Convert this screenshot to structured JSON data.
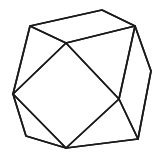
{
  "figure": {
    "background_color": "#ffffff",
    "stroke_color": "#1a1a1a",
    "stroke_width": 1.7,
    "canvas": {
      "width": 161,
      "height": 163
    }
  },
  "chart_data": {
    "type": "diagram",
    "vertices": [
      {
        "id": "v0",
        "name": "top-left",
        "x": 30,
        "y": 26
      },
      {
        "id": "v1",
        "name": "top-peak",
        "x": 102,
        "y": 10
      },
      {
        "id": "v2",
        "name": "top-right",
        "x": 135,
        "y": 26
      },
      {
        "id": "v3",
        "name": "right",
        "x": 151,
        "y": 71
      },
      {
        "id": "v4",
        "name": "bottom-right",
        "x": 138,
        "y": 139
      },
      {
        "id": "v5",
        "name": "bottom",
        "x": 66,
        "y": 148
      },
      {
        "id": "v6",
        "name": "bottom-left",
        "x": 26,
        "y": 136
      },
      {
        "id": "v7",
        "name": "left",
        "x": 13,
        "y": 94
      },
      {
        "id": "v8",
        "name": "inner-upper",
        "x": 66,
        "y": 43
      },
      {
        "id": "v9",
        "name": "inner-lower-right",
        "x": 119,
        "y": 99
      }
    ],
    "edges": [
      {
        "from": "v0",
        "to": "v1",
        "name": "outline-top-left-to-peak"
      },
      {
        "from": "v1",
        "to": "v2",
        "name": "outline-peak-to-top-right"
      },
      {
        "from": "v2",
        "to": "v3",
        "name": "outline-top-right-to-right"
      },
      {
        "from": "v3",
        "to": "v4",
        "name": "outline-right-to-bottom-right"
      },
      {
        "from": "v4",
        "to": "v5",
        "name": "outline-bottom-right-to-bottom"
      },
      {
        "from": "v5",
        "to": "v6",
        "name": "outline-bottom-to-bottom-left"
      },
      {
        "from": "v6",
        "to": "v7",
        "name": "outline-bottom-left-to-left"
      },
      {
        "from": "v7",
        "to": "v0",
        "name": "outline-left-to-top-left"
      },
      {
        "from": "v0",
        "to": "v8",
        "name": "inner-top-left-to-inner-upper"
      },
      {
        "from": "v2",
        "to": "v8",
        "name": "inner-top-right-to-inner-upper"
      },
      {
        "from": "v8",
        "to": "v7",
        "name": "inner-square-upper-left"
      },
      {
        "from": "v8",
        "to": "v9",
        "name": "inner-square-upper-right"
      },
      {
        "from": "v9",
        "to": "v5",
        "name": "inner-square-lower-right"
      },
      {
        "from": "v5",
        "to": "v7",
        "name": "inner-square-lower-left"
      },
      {
        "from": "v2",
        "to": "v9",
        "name": "inner-top-right-to-inner-lower"
      },
      {
        "from": "v4",
        "to": "v9",
        "name": "inner-bottom-right-to-inner-lower"
      }
    ],
    "paths": {
      "outline": "M30,26 L102,10 L135,26 L151,71 L138,139 L66,148 L26,136 L13,94 Z",
      "top_face": "M30,26 L102,10 L135,26 L66,43 Z",
      "inner_square": "M66,43 L119,99 L66,148 L13,94 Z",
      "right_face": "M135,26 L151,71 L138,139 L119,99 Z",
      "upper_left_triangle": "M30,26 L66,43 L13,94 Z",
      "upper_right_triangle": "M135,26 L119,99 L66,43 Z",
      "lower_left_triangle": "M13,94 L66,148 L26,136 Z",
      "lower_right_triangle": "M119,99 L138,139 L66,148 Z"
    },
    "counts": {
      "vertices": 10,
      "edges": 16,
      "visible_faces": 8
    }
  }
}
